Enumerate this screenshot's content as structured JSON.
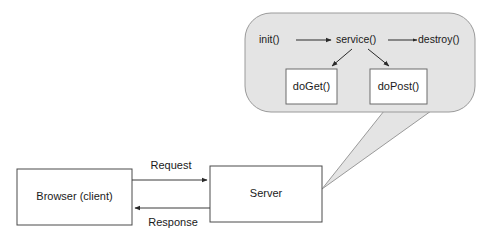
{
  "diagram": {
    "background_color": "#ffffff",
    "bubble": {
      "fill_color": "#e4e4e4",
      "stroke_color": "#9a9a9a",
      "lifecycle": {
        "init_label": "init()",
        "service_label": "service()",
        "destroy_label": "destroy()",
        "methods": [
          {
            "label": "doGet()"
          },
          {
            "label": "doPost()"
          }
        ]
      }
    },
    "nodes": [
      {
        "id": "browser",
        "label": "Browser (client)"
      },
      {
        "id": "server",
        "label": "Server"
      }
    ],
    "edges": [
      {
        "id": "request",
        "label": "Request",
        "direction": "browser-to-server"
      },
      {
        "id": "response",
        "label": "Response",
        "direction": "server-to-browser"
      }
    ]
  }
}
